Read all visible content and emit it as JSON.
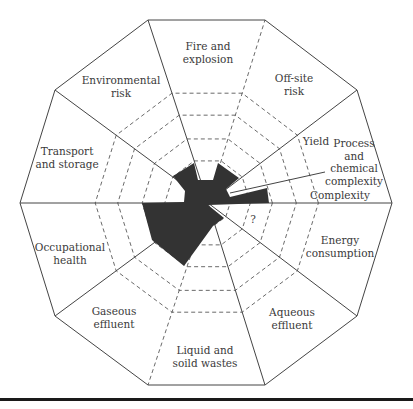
{
  "diagram": {
    "type": "radar-decagon",
    "center": [
      208,
      203
    ],
    "outer_vertices": [
      [
        392,
        203
      ],
      [
        357,
        90
      ],
      [
        265,
        20
      ],
      [
        148,
        20
      ],
      [
        55,
        90
      ],
      [
        20,
        203
      ],
      [
        55,
        316
      ],
      [
        148,
        385
      ],
      [
        265,
        385
      ],
      [
        357,
        316
      ]
    ],
    "ring_fractions": [
      0.12,
      0.23,
      0.35,
      0.48,
      0.6
    ],
    "colors": {
      "line": "#444444",
      "fill": "#333333",
      "text": "#3a3a3a",
      "rule": "#1a1a1a"
    },
    "sectors": [
      {
        "id": "fire-and-explosion",
        "lines": [
          "Fire and",
          "explosion"
        ],
        "x": 208,
        "y": 50
      },
      {
        "id": "off-site-risk",
        "lines": [
          "Off-site",
          "risk"
        ],
        "x": 294,
        "y": 82
      },
      {
        "id": "environmental-risk",
        "lines": [
          "Environmental",
          "risk"
        ],
        "x": 121,
        "y": 84
      },
      {
        "id": "transport-and-storage",
        "lines": [
          "Transport",
          "and storage"
        ],
        "x": 67,
        "y": 155
      },
      {
        "id": "process-complexity",
        "lines": [
          "Process",
          "and",
          "chemical",
          "complexity"
        ],
        "x": 354,
        "y": 147
      },
      {
        "id": "energy-consumption",
        "lines": [
          "Energy",
          "consumption"
        ],
        "x": 340,
        "y": 244
      },
      {
        "id": "occupational-health",
        "lines": [
          "Occupational",
          "health"
        ],
        "x": 70,
        "y": 251
      },
      {
        "id": "gaseous-effluent",
        "lines": [
          "Gaseous",
          "effluent"
        ],
        "x": 114,
        "y": 315
      },
      {
        "id": "aqueous-effluent",
        "lines": [
          "Aqueous",
          "effluent"
        ],
        "x": 292,
        "y": 316
      },
      {
        "id": "liquid-and-soild-wastes",
        "lines": [
          "Liquid and",
          "soild wastes"
        ],
        "x": 205,
        "y": 354
      }
    ],
    "sub_labels": [
      {
        "id": "yield",
        "text": "Yield",
        "x": 316,
        "y": 145
      },
      {
        "id": "complexity",
        "text": "Complexity",
        "x": 340,
        "y": 199
      },
      {
        "id": "unknown",
        "text": "?",
        "x": 253,
        "y": 223
      }
    ],
    "shape_points": [
      [
        142,
        203
      ],
      [
        152,
        240
      ],
      [
        184,
        266
      ],
      [
        213,
        226
      ],
      [
        224,
        218
      ],
      [
        208,
        205
      ],
      [
        269,
        203
      ],
      [
        267,
        188
      ],
      [
        230,
        197
      ],
      [
        226,
        189
      ],
      [
        239,
        178
      ],
      [
        218,
        163
      ],
      [
        213,
        180
      ],
      [
        198,
        180
      ],
      [
        194,
        163
      ],
      [
        173,
        176
      ],
      [
        185,
        191
      ],
      [
        184,
        202
      ]
    ]
  }
}
